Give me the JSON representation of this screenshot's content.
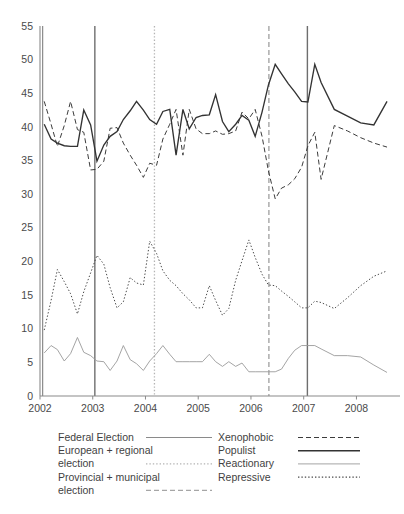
{
  "chart_data": {
    "type": "line",
    "title": "",
    "subtitle": "",
    "xlabel": "",
    "ylabel": "",
    "xlim": [
      2002.0,
      2008.75
    ],
    "ylim": [
      0,
      55
    ],
    "grid": false,
    "legend_position": "bottom",
    "y_ticks": [
      0,
      5,
      10,
      15,
      20,
      25,
      30,
      35,
      40,
      45,
      50,
      55
    ],
    "x_ticks": [
      2002,
      2003,
      2004,
      2005,
      2006,
      2007,
      2008
    ],
    "x_tick_labels": [
      "2002",
      "2003",
      "2004",
      "2005",
      "2006",
      "2007",
      "2008"
    ],
    "series": [
      {
        "name": "Xenophobic",
        "style": "dashed",
        "color": "#3c3c3c",
        "width": 1.0,
        "x": [
          2002.08,
          2002.21,
          2002.33,
          2002.46,
          2002.58,
          2002.71,
          2002.83,
          2002.96,
          2003.08,
          2003.21,
          2003.33,
          2003.46,
          2003.58,
          2003.71,
          2003.83,
          2003.96,
          2004.08,
          2004.21,
          2004.33,
          2004.46,
          2004.58,
          2004.71,
          2004.83,
          2004.96,
          2005.08,
          2005.21,
          2005.33,
          2005.46,
          2005.58,
          2005.71,
          2005.83,
          2005.96,
          2006.08,
          2006.21,
          2006.33,
          2006.46,
          2006.58,
          2006.71,
          2006.83,
          2006.96,
          2007.08,
          2007.21,
          2007.33,
          2007.58,
          2007.83,
          2008.08,
          2008.33,
          2008.58
        ],
        "y": [
          43.8,
          40.4,
          37.1,
          40.2,
          43.8,
          39.6,
          39.2,
          33.6,
          33.7,
          34.9,
          39.8,
          39.9,
          37.6,
          35.8,
          34.3,
          32.5,
          34.6,
          34.3,
          38.2,
          40.4,
          42.6,
          35.8,
          42.6,
          39.7,
          39.0,
          39.0,
          39.4,
          38.9,
          39.0,
          39.4,
          42.2,
          41.2,
          42.6,
          38.6,
          33.5,
          29.3,
          30.9,
          31.4,
          32.3,
          34.0,
          37.2,
          39.2,
          32.2,
          40.2,
          39.4,
          38.4,
          37.6,
          37.0
        ]
      },
      {
        "name": "Populist",
        "style": "solid",
        "color": "#333333",
        "width": 1.35,
        "x": [
          2002.08,
          2002.21,
          2002.33,
          2002.46,
          2002.58,
          2002.71,
          2002.83,
          2002.96,
          2003.08,
          2003.21,
          2003.33,
          2003.46,
          2003.58,
          2003.71,
          2003.83,
          2003.96,
          2004.08,
          2004.21,
          2004.33,
          2004.46,
          2004.58,
          2004.71,
          2004.83,
          2004.96,
          2005.08,
          2005.21,
          2005.33,
          2005.46,
          2005.58,
          2005.71,
          2005.83,
          2005.96,
          2006.08,
          2006.21,
          2006.33,
          2006.46,
          2006.58,
          2006.71,
          2006.83,
          2006.96,
          2007.08,
          2007.21,
          2007.33,
          2007.58,
          2007.83,
          2008.08,
          2008.33,
          2008.58
        ],
        "y": [
          40.4,
          38.2,
          37.6,
          37.2,
          37.1,
          37.1,
          42.5,
          40.3,
          34.9,
          37.3,
          38.6,
          39.3,
          41.1,
          42.4,
          43.8,
          42.5,
          41.1,
          40.4,
          42.3,
          42.6,
          35.8,
          42.6,
          39.7,
          41.4,
          41.7,
          41.8,
          44.8,
          40.8,
          39.3,
          40.4,
          41.7,
          41.0,
          38.6,
          42.2,
          46.2,
          49.3,
          47.9,
          46.4,
          45.2,
          43.8,
          43.7,
          49.3,
          46.6,
          42.6,
          41.6,
          40.6,
          40.3,
          43.8
        ]
      },
      {
        "name": "Reactionary",
        "style": "solid",
        "color": "#9a9a9a",
        "width": 0.9,
        "x": [
          2002.08,
          2002.21,
          2002.33,
          2002.46,
          2002.58,
          2002.71,
          2002.83,
          2002.96,
          2003.08,
          2003.21,
          2003.33,
          2003.46,
          2003.58,
          2003.71,
          2003.83,
          2003.96,
          2004.08,
          2004.21,
          2004.33,
          2004.46,
          2004.58,
          2004.71,
          2004.83,
          2004.96,
          2005.08,
          2005.21,
          2005.33,
          2005.46,
          2005.58,
          2005.71,
          2005.83,
          2005.96,
          2006.08,
          2006.21,
          2006.33,
          2006.46,
          2006.58,
          2006.71,
          2006.83,
          2006.96,
          2007.08,
          2007.21,
          2007.33,
          2007.58,
          2007.83,
          2008.08,
          2008.33,
          2008.58
        ],
        "y": [
          6.4,
          7.5,
          6.9,
          5.2,
          6.3,
          8.7,
          6.5,
          6.0,
          5.2,
          5.1,
          3.8,
          5.2,
          7.5,
          5.4,
          4.8,
          3.8,
          5.2,
          6.3,
          7.5,
          6.2,
          5.1,
          5.1,
          5.1,
          5.1,
          5.1,
          6.2,
          5.1,
          4.4,
          5.1,
          4.4,
          4.9,
          3.6,
          3.6,
          3.6,
          3.6,
          3.6,
          4.0,
          5.6,
          6.8,
          7.5,
          7.5,
          7.5,
          7.0,
          6.0,
          6.0,
          5.8,
          4.6,
          3.5
        ]
      },
      {
        "name": "Repressive",
        "style": "dotted",
        "color": "#4a4a4a",
        "width": 1.0,
        "x": [
          2002.08,
          2002.21,
          2002.33,
          2002.46,
          2002.58,
          2002.71,
          2002.83,
          2002.96,
          2003.08,
          2003.21,
          2003.33,
          2003.46,
          2003.58,
          2003.71,
          2003.83,
          2003.96,
          2004.08,
          2004.21,
          2004.33,
          2004.46,
          2004.58,
          2004.71,
          2004.83,
          2004.96,
          2005.08,
          2005.21,
          2005.33,
          2005.46,
          2005.58,
          2005.71,
          2005.83,
          2005.96,
          2006.08,
          2006.21,
          2006.33,
          2006.46,
          2006.58,
          2006.71,
          2006.83,
          2006.96,
          2007.08,
          2007.21,
          2007.33,
          2007.58,
          2007.83,
          2008.08,
          2008.33,
          2008.58
        ],
        "y": [
          9.8,
          14.2,
          18.8,
          17.0,
          15.2,
          12.2,
          15.5,
          18.3,
          20.9,
          19.6,
          16.1,
          13.1,
          14.0,
          17.6,
          16.8,
          16.5,
          23.0,
          21.2,
          18.6,
          17.2,
          16.4,
          15.2,
          14.3,
          13.1,
          13.1,
          16.4,
          14.2,
          12.0,
          13.0,
          17.2,
          20.1,
          23.2,
          20.6,
          18.1,
          16.5,
          16.4,
          15.6,
          14.8,
          14.0,
          13.1,
          13.1,
          14.1,
          13.9,
          13.0,
          14.6,
          16.4,
          17.8,
          18.6
        ]
      }
    ],
    "vertical_markers": [
      {
        "label": "Federal Election",
        "x": 2002.05,
        "style": "solid",
        "color": "#8a8a8a",
        "width": 1.2
      },
      {
        "label": "Federal Election",
        "x": 2003.04,
        "style": "solid",
        "color": "#6e6e6e",
        "width": 1.4
      },
      {
        "label": "European + regional election",
        "x": 2004.17,
        "style": "dotted",
        "color": "#b4b4b4",
        "width": 1.3
      },
      {
        "label": "Provincial + municipal election",
        "x": 2006.34,
        "style": "dashed",
        "color": "#a6a6a6",
        "width": 1.4
      },
      {
        "label": "Federal Election",
        "x": 2007.07,
        "style": "solid",
        "color": "#6e6e6e",
        "width": 1.4
      }
    ]
  },
  "legend": {
    "left_column": [
      {
        "label": "Federal Election",
        "style": "solid",
        "color": "#8a8a8a"
      },
      {
        "label": "European + regional election",
        "style": "dotted",
        "color": "#b4b4b4"
      },
      {
        "label": "Provincial + municipal election",
        "style": "dashed",
        "color": "#a6a6a6"
      }
    ],
    "right_column": [
      {
        "label": "Xenophobic",
        "style": "dashed",
        "color": "#3c3c3c"
      },
      {
        "label": "Populist",
        "style": "solid",
        "color": "#333333"
      },
      {
        "label": "Reactionary",
        "style": "solid",
        "color": "#9a9a9a"
      },
      {
        "label": "Repressive",
        "style": "dotted",
        "color": "#4a4a4a"
      }
    ]
  }
}
